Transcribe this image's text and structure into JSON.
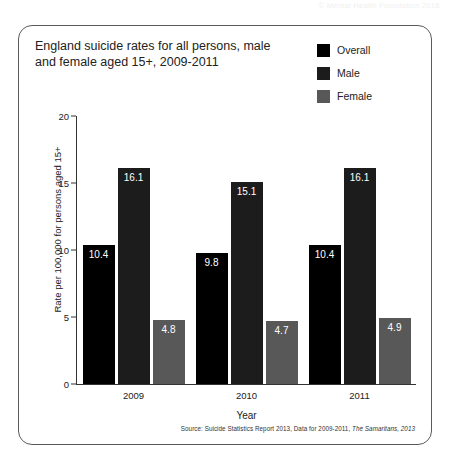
{
  "page": {
    "header_note": "© Mental Health Foundation 2016"
  },
  "card": {
    "title": "England suicide rates for all persons, male and female aged 15+, 2009-2011",
    "source_prefix": "Source: Suicide Statistics Report 2013, Data for 2009-2011, ",
    "source_italic": "The Samaritans, 2013"
  },
  "chart_data": {
    "type": "bar",
    "title": "England suicide rates for all persons, male and female aged 15+, 2009-2011",
    "xlabel": "Year",
    "ylabel": "Rate per 100,000 for persons aged 15+",
    "categories": [
      "2009",
      "2010",
      "2011"
    ],
    "ylim": [
      0,
      20
    ],
    "yticks": [
      0,
      5,
      10,
      15,
      20
    ],
    "grid": false,
    "legend_position": "top-right",
    "series": [
      {
        "name": "Overall",
        "color": "#000000",
        "values": [
          10.4,
          9.8,
          10.4
        ]
      },
      {
        "name": "Male",
        "color": "#1c1c1c",
        "values": [
          16.1,
          15.1,
          16.1
        ]
      },
      {
        "name": "Female",
        "color": "#585858",
        "values": [
          4.8,
          4.7,
          4.9
        ]
      }
    ]
  }
}
